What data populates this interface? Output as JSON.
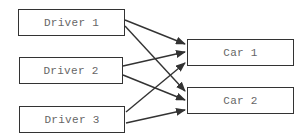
{
  "diagram": {
    "type": "bipartite-mapping",
    "colors": {
      "stroke": "#333333",
      "text": "#666666",
      "background": "#ffffff"
    },
    "nodes": [
      {
        "id": "driver1",
        "label": "Driver 1",
        "x": 18,
        "y": 9,
        "w": 107,
        "h": 27
      },
      {
        "id": "driver2",
        "label": "Driver 2",
        "x": 19,
        "y": 57,
        "w": 104,
        "h": 27
      },
      {
        "id": "driver3",
        "label": "Driver 3",
        "x": 19,
        "y": 106,
        "w": 106,
        "h": 27
      },
      {
        "id": "car1",
        "label": "Car 1",
        "x": 187,
        "y": 39,
        "w": 107,
        "h": 27
      },
      {
        "id": "car2",
        "label": "Car 2",
        "x": 187,
        "y": 87,
        "w": 107,
        "h": 27
      }
    ],
    "edges": [
      {
        "from": "driver1",
        "to": "car1",
        "x1": 125,
        "y1": 20,
        "x2": 185,
        "y2": 44
      },
      {
        "from": "driver1",
        "to": "car2",
        "x1": 125,
        "y1": 26,
        "x2": 185,
        "y2": 91
      },
      {
        "from": "driver2",
        "to": "car1",
        "x1": 123,
        "y1": 66,
        "x2": 185,
        "y2": 52
      },
      {
        "from": "driver2",
        "to": "car2",
        "x1": 123,
        "y1": 75,
        "x2": 185,
        "y2": 100
      },
      {
        "from": "driver3",
        "to": "car1",
        "x1": 126,
        "y1": 112,
        "x2": 185,
        "y2": 63
      },
      {
        "from": "driver3",
        "to": "car2",
        "x1": 126,
        "y1": 123,
        "x2": 185,
        "y2": 110
      }
    ]
  }
}
